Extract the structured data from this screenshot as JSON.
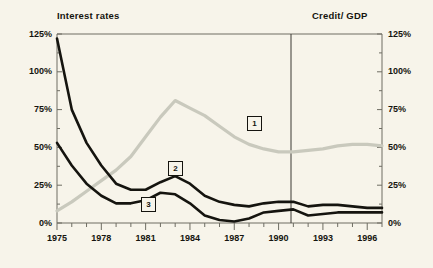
{
  "titles": {
    "left": "Interest rates",
    "right": "Credit/ GDP"
  },
  "axis": {
    "y_left_ticks": [
      "125%",
      "100%",
      "75%",
      "50%",
      "25%",
      "0%"
    ],
    "y_right_ticks": [
      "125%",
      "100%",
      "75%",
      "50%",
      "25%",
      "0%"
    ],
    "x_ticks": [
      "1975",
      "1978",
      "1981",
      "1984",
      "1987",
      "1990",
      "1993",
      "1996"
    ]
  },
  "labels": {
    "one": "1",
    "two": "2",
    "three": "3"
  },
  "colors": {
    "background": "#f7f4ea",
    "ink": "#15140f",
    "series_gray": "#c9c9bd",
    "frame": "#6e6d63"
  },
  "chart_data": {
    "type": "line",
    "xlabel": "",
    "ylabel": "percent",
    "ylim": [
      0,
      125
    ],
    "xlim": [
      1975,
      1997
    ],
    "grid": false,
    "legend": "inline boxed numbers",
    "annotations": [
      {
        "label": "1",
        "series": "Credit/ GDP",
        "x": 1986,
        "y": 63
      },
      {
        "label": "2",
        "series": "Interest rate 2",
        "x": 1981.5,
        "y": 36
      },
      {
        "label": "3",
        "series": "Interest rate 3",
        "x": 1980,
        "y": 13
      },
      {
        "label": "vertical divider",
        "x": 1991,
        "y": null
      }
    ],
    "x": [
      1975,
      1976,
      1977,
      1978,
      1979,
      1980,
      1981,
      1982,
      1983,
      1984,
      1985,
      1986,
      1987,
      1988,
      1989,
      1990,
      1991,
      1992,
      1993,
      1994,
      1995,
      1996,
      1997
    ],
    "series": [
      {
        "name": "Credit/ GDP",
        "key": "1",
        "color": "#c9c9bd",
        "axis": "right",
        "values": [
          8,
          14,
          21,
          28,
          35,
          44,
          57,
          70,
          81,
          76,
          71,
          64,
          57,
          52,
          49,
          47,
          47,
          48,
          49,
          51,
          52,
          52,
          51
        ]
      },
      {
        "name": "Interest rate 2",
        "key": "2",
        "color": "#15140f",
        "axis": "left",
        "values": [
          122,
          75,
          53,
          38,
          26,
          22,
          22,
          27,
          31,
          26,
          18,
          14,
          12,
          11,
          13,
          14,
          14,
          11,
          12,
          12,
          11,
          10,
          10
        ]
      },
      {
        "name": "Interest rate 3",
        "key": "3",
        "color": "#15140f",
        "axis": "left",
        "values": [
          53,
          38,
          26,
          18,
          13,
          13,
          15,
          20,
          19,
          13,
          5,
          2,
          1,
          3,
          7,
          8,
          9,
          5,
          6,
          7,
          7,
          7,
          7
        ]
      }
    ]
  }
}
